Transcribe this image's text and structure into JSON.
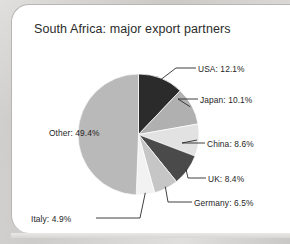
{
  "chart_data": {
    "type": "pie",
    "title": "South Africa: major export partners",
    "categories": [
      "USA",
      "Japan",
      "China",
      "UK",
      "Germany",
      "Italy",
      "Other"
    ],
    "values": [
      12.1,
      10.1,
      8.6,
      8.4,
      6.5,
      4.9,
      49.4
    ],
    "unit": "%",
    "labels": [
      "USA: 12.1%",
      "Japan: 10.1%",
      "China: 8.6%",
      "UK: 8.4%",
      "Germany: 6.5%",
      "Italy: 4.9%",
      "Other: 49.4%"
    ],
    "slice_colors": [
      "#2b2b2b",
      "#b0b0b0",
      "#e2e2e2",
      "#4a4a4a",
      "#c6c6c6",
      "#f2f2f2",
      "#b9b9b9"
    ],
    "start_angle_deg": 0,
    "direction": "clockwise",
    "legend": "callout-labels",
    "grid": false,
    "xlabel": "",
    "ylabel": ""
  },
  "card": {
    "background_color": "#ffffff",
    "border_color": "#b6b5b2"
  },
  "page": {
    "background_color": "#c9c8c6"
  }
}
